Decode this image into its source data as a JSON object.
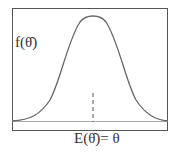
{
  "diagram": {
    "type": "normal-distribution-curve",
    "y_axis_label": "f(θ̂)",
    "x_axis_label": "E(θ̂)= θ",
    "mean_marker": "dashed vertical line at mean",
    "colors": {
      "curve": "#666666",
      "frame": "#555555",
      "baseline": "#999999",
      "text": "#333333"
    }
  }
}
